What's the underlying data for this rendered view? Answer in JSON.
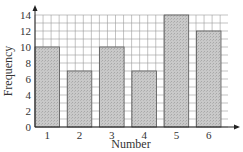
{
  "chart_data": {
    "type": "bar",
    "title": "",
    "xlabel": "Number",
    "ylabel": "Frequency",
    "categories": [
      "1",
      "2",
      "3",
      "4",
      "5",
      "6"
    ],
    "values": [
      10,
      7,
      10,
      7,
      14,
      12
    ],
    "ylim": [
      0,
      14
    ],
    "yticks": [
      0,
      2,
      4,
      6,
      8,
      10,
      12,
      14
    ],
    "grid": true,
    "legend": null
  },
  "colors": {
    "bar_fill": "#c4c4c4",
    "bar_stroke": "#555555",
    "grid": "#9a9a9a",
    "axis": "#222222",
    "text": "#333333"
  }
}
